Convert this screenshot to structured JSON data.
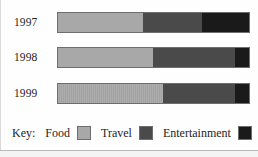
{
  "chart_data": {
    "type": "bar",
    "orientation": "horizontal",
    "stacked": true,
    "title": "",
    "xlabel": "",
    "ylabel": "",
    "categories": [
      "1997",
      "1998",
      "1999"
    ],
    "series": [
      {
        "name": "Food",
        "color": "#a8a8a8",
        "values": [
          44.6,
          49.7,
          54.9
        ]
      },
      {
        "name": "Travel",
        "color": "#4a4a4a",
        "values": [
          30.6,
          43.0,
          37.8
        ]
      },
      {
        "name": "Entertainment",
        "color": "#1a1a1a",
        "values": [
          24.8,
          7.3,
          7.3
        ]
      }
    ],
    "units": "percent",
    "xlim": [
      0,
      100
    ],
    "grid": false,
    "legend_position": "bottom"
  },
  "rows": [
    {
      "year": "1997",
      "segments": [
        {
          "key": "food",
          "pct": 44.6
        },
        {
          "key": "travel",
          "pct": 30.6
        },
        {
          "key": "entertainment",
          "pct": 24.8
        }
      ]
    },
    {
      "year": "1998",
      "segments": [
        {
          "key": "food",
          "pct": 49.7
        },
        {
          "key": "travel",
          "pct": 43.0
        },
        {
          "key": "entertainment",
          "pct": 7.3
        }
      ]
    },
    {
      "year": "1999",
      "segments": [
        {
          "key": "food",
          "pct": 54.9
        },
        {
          "key": "travel",
          "pct": 37.8
        },
        {
          "key": "entertainment",
          "pct": 7.3
        }
      ]
    }
  ],
  "legend": {
    "title": "Key:",
    "items": [
      {
        "label": "Food",
        "color": "#a8a8a8"
      },
      {
        "label": "Travel",
        "color": "#4a4a4a"
      },
      {
        "label": "Entertainment",
        "color": "#1a1a1a"
      }
    ]
  },
  "colors": {
    "food": "#a8a8a8",
    "travel": "#4a4a4a",
    "entertainment": "#1a1a1a",
    "background": "#fefefe",
    "text": "#1d1d1d",
    "bar_border": "#6d6d6d"
  }
}
